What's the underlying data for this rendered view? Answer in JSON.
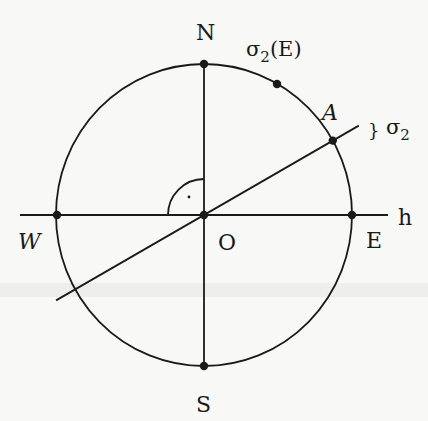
{
  "diagram": {
    "title": "",
    "points": {
      "N": {
        "label": "N"
      },
      "S": {
        "label": "S"
      },
      "E": {
        "label": "E"
      },
      "W": {
        "label": "W"
      },
      "O": {
        "label": "O"
      },
      "A": {
        "label": "A"
      },
      "sigma2E": {
        "label_base": "σ",
        "label_sub": "2",
        "label_suffix": "(E)"
      }
    },
    "lines": {
      "horizon": {
        "label": "h"
      },
      "plane": {
        "label_base": "σ",
        "label_sub": "2",
        "tilde": "}"
      }
    },
    "angle_mark": {
      "type": "right-angle",
      "dot": "·"
    },
    "plane_tilt_deg": 30,
    "colors": {
      "ink": "#1a1a1a",
      "paper": "#f8f8f6",
      "band": "#e2e2e0"
    }
  }
}
